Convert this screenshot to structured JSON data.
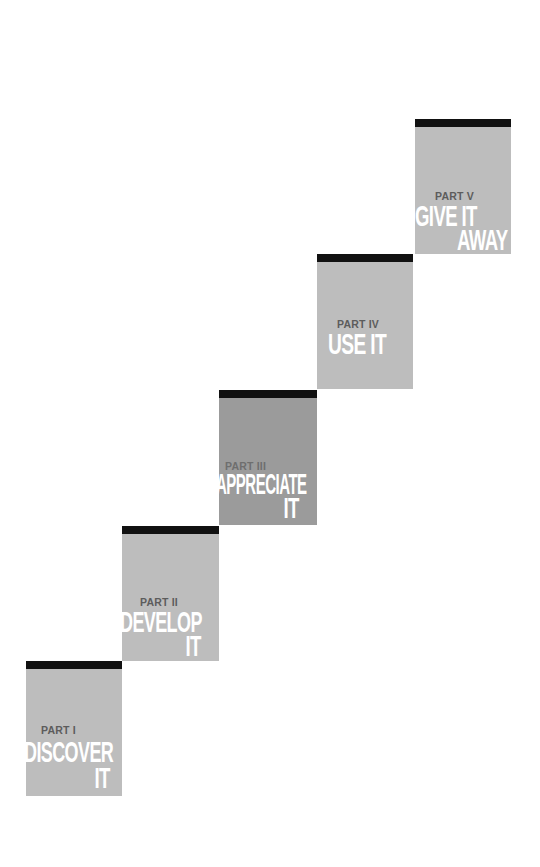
{
  "steps": [
    {
      "part": "PART I",
      "line1": "DISCOVER",
      "line2": "IT",
      "shade": "#bdbdbd"
    },
    {
      "part": "PART II",
      "line1": "DEVELOP",
      "line2": "IT",
      "shade": "#bdbdbd"
    },
    {
      "part": "PART III",
      "line1": "APPRECIATE",
      "line2": "IT",
      "shade": "#9b9b9b"
    },
    {
      "part": "PART IV",
      "line1": "USE IT",
      "line2": "",
      "shade": "#bdbdbd"
    },
    {
      "part": "PART V",
      "line1": "GIVE IT",
      "line2": "AWAY",
      "shade": "#bdbdbd"
    }
  ],
  "colors": {
    "bar": "#111111",
    "fill_light": "#bdbdbd",
    "fill_dark": "#9b9b9b",
    "label": "#5c5c5c",
    "heading": "#ffffff"
  }
}
